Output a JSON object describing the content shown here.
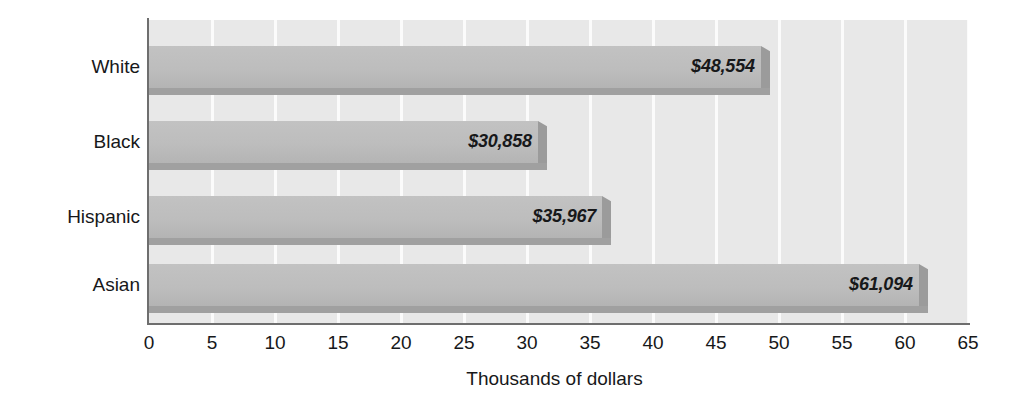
{
  "chart_data": {
    "type": "bar",
    "orientation": "horizontal",
    "title": "",
    "xlabel": "Thousands of dollars",
    "ylabel": "",
    "categories": [
      "White",
      "Black",
      "Hispanic",
      "Asian"
    ],
    "values": [
      48554,
      35858,
      35967,
      61094
    ],
    "value_labels": [
      "$48,554",
      "$30,858",
      "$35,967",
      "$61,094"
    ],
    "values_thousands": [
      48.554,
      30.858,
      35.967,
      61.094
    ],
    "xlim": [
      0,
      65
    ],
    "xticks": [
      0,
      5,
      10,
      15,
      20,
      25,
      30,
      35,
      40,
      45,
      50,
      55,
      60,
      65
    ],
    "xtick_labels": [
      "0",
      "5",
      "10",
      "15",
      "20",
      "25",
      "30",
      "35",
      "40",
      "45",
      "50",
      "55",
      "60",
      "65"
    ],
    "grid": "vertical",
    "legend": "none",
    "colors": {
      "plot_background": "#e8e8e8",
      "gridline": "#fbfbfb",
      "bar_fill": "#bdbdbd",
      "bar_shadow": "#a0a0a0",
      "axis_line": "#6e6e6e",
      "text": "#17181a",
      "page_background": "#ffffff"
    },
    "series": [
      {
        "name": "Median household income",
        "points": [
          {
            "category": "White",
            "value": 48554,
            "label": "$48,554"
          },
          {
            "category": "Black",
            "value": 30858,
            "label": "$30,858"
          },
          {
            "category": "Hispanic",
            "value": 35967,
            "label": "$35,967"
          },
          {
            "category": "Asian",
            "value": 61094,
            "label": "$61,094"
          }
        ]
      }
    ]
  },
  "geometry": {
    "plot_left": 149,
    "plot_right": 968,
    "plot_top": 20,
    "plot_bottom": 323,
    "px_per_unit": 12.6,
    "bars": [
      {
        "top": 46,
        "height": 42,
        "label_top": 52
      },
      {
        "top": 121,
        "height": 42,
        "label_top": 127
      },
      {
        "top": 196,
        "height": 42,
        "label_top": 202
      },
      {
        "top": 264,
        "height": 42,
        "label_top": 270
      }
    ]
  }
}
